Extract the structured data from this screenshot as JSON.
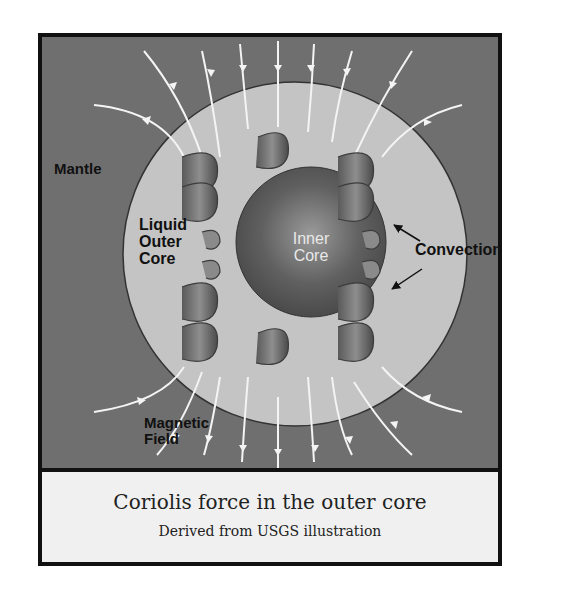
{
  "figure": {
    "labels": {
      "mantle": "Mantle",
      "outer_core": "Liquid\nOuter\nCore",
      "inner_core": "Inner\nCore",
      "convection": "Convection",
      "magnetic_field": "Magnetic\nField"
    },
    "caption": {
      "title": "Coriolis force in the outer core",
      "subtitle": "Derived from USGS illustration"
    },
    "colors": {
      "mantle": "#6f6f6f",
      "outer_core": "#c4c4c4",
      "inner_core": "#5c5c5c",
      "field_lines": "#f4f4f4",
      "helix": "#7a7a7a",
      "caption_bg": "#f0f0f0",
      "border": "#111111"
    }
  }
}
